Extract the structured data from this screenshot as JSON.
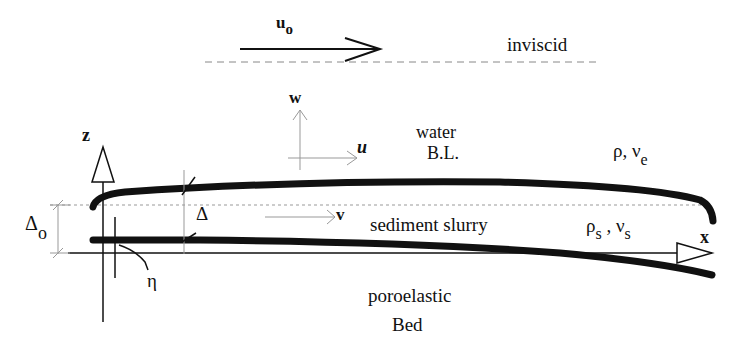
{
  "diagram": {
    "labels": {
      "free_stream_velocity": "u",
      "free_stream_velocity_sub": "o",
      "inviscid": "inviscid",
      "w": "w",
      "u": "u",
      "water": "water",
      "bl": "B.L.",
      "rho": "ρ, ν",
      "rho_sub": "e",
      "z": "z",
      "delta": "Δ",
      "delta_o": "Δ",
      "delta_o_sub": "o",
      "v": "v",
      "sediment_slurry": "sediment slurry",
      "rho_s": "ρ",
      "rho_s_sub": "s",
      "comma": " , ",
      "nu_s": "ν",
      "nu_s_sub": "s",
      "x": "x",
      "eta": "η",
      "poroelastic": "poroelastic",
      "bed": "Bed"
    },
    "colors": {
      "ink": "#111111",
      "dashed": "#888888",
      "thin": "#999999"
    }
  }
}
